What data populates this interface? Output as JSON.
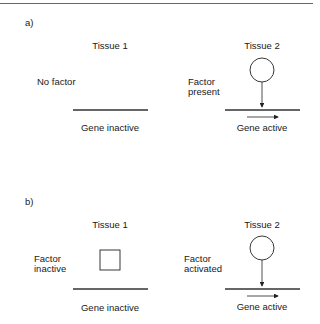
{
  "panels": [
    {
      "label": "a)",
      "tissue1": {
        "title": "Tissue 1",
        "factor_label_line1": "No factor",
        "factor_label_line2": "",
        "gene_label": "Gene inactive",
        "factor_shape": "none"
      },
      "tissue2": {
        "title": "Tissue 2",
        "factor_label_line1": "Factor",
        "factor_label_line2": "present",
        "gene_label": "Gene active",
        "factor_shape": "circle"
      }
    },
    {
      "label": "b)",
      "tissue1": {
        "title": "Tissue 1",
        "factor_label_line1": "Factor",
        "factor_label_line2": "inactive",
        "gene_label": "Gene inactive",
        "factor_shape": "square"
      },
      "tissue2": {
        "title": "Tissue 2",
        "factor_label_line1": "Factor",
        "factor_label_line2": "activated",
        "gene_label": "Gene active",
        "factor_shape": "circle"
      }
    }
  ],
  "colors": {
    "line": "#222222",
    "text": "#1a1a1a",
    "border": "#666666"
  }
}
